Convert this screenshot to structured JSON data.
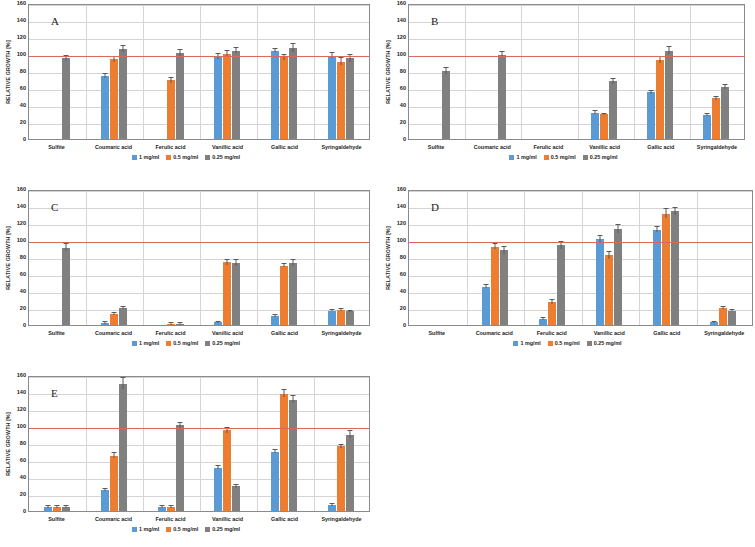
{
  "figure": {
    "ylabel": "RELATIVE GROWTH [%]",
    "ylim": [
      0,
      160
    ],
    "yticks": [
      0,
      20,
      40,
      60,
      80,
      100,
      120,
      140,
      160
    ],
    "categories": [
      "Sulfite",
      "Coumaric acid",
      "Ferulic acid",
      "Vanillic acid",
      "Gallic acid",
      "Syringaldehyde"
    ],
    "series_names": [
      "1 mg/ml",
      "0.5 mg/ml",
      "0.25 mg/ml"
    ],
    "colors": {
      "series_1": "#5B9BD5",
      "series_2": "#ED7D31",
      "series_3": "#808080",
      "reference_line": "#D9695A",
      "grid": "#d4d4d4",
      "axis": "#8a8a8a"
    },
    "reference_line_value": 100
  },
  "chart_data": [
    {
      "type": "bar",
      "panel": "A",
      "title": "A",
      "xlabel": "",
      "ylabel": "RELATIVE GROWTH [%]",
      "ylim": [
        0,
        160
      ],
      "grid": true,
      "legend_position": "bottom",
      "reference_line": 100,
      "categories": [
        "Sulfite",
        "Coumaric acid",
        "Ferulic acid",
        "Vanillic acid",
        "Gallic acid",
        "Syringaldehyde"
      ],
      "series": [
        {
          "name": "1 mg/ml",
          "values": [
            0,
            74,
            0,
            97,
            104,
            98
          ],
          "errors": [
            0,
            2,
            0,
            3,
            2,
            3
          ]
        },
        {
          "name": "0.5 mg/ml",
          "values": [
            0,
            94,
            69,
            100,
            96,
            91
          ],
          "errors": [
            0,
            3,
            3,
            3,
            3,
            4
          ]
        },
        {
          "name": "0.25 mg/ml",
          "values": [
            95,
            106,
            101,
            104,
            107,
            95
          ],
          "errors": [
            3,
            4,
            4,
            3,
            5,
            4
          ]
        }
      ]
    },
    {
      "type": "bar",
      "panel": "B",
      "title": "B",
      "xlabel": "",
      "ylabel": "RELATIVE GROWTH [%]",
      "ylim": [
        0,
        160
      ],
      "grid": true,
      "legend_position": "bottom",
      "reference_line": 100,
      "categories": [
        "Sulfite",
        "Coumaric acid",
        "Ferulic acid",
        "Vanillic acid",
        "Gallic acid",
        "Syringaldehyde"
      ],
      "series": [
        {
          "name": "1 mg/ml",
          "values": [
            0,
            0,
            0,
            31,
            55,
            28
          ],
          "errors": [
            0,
            0,
            0,
            2,
            2,
            1
          ]
        },
        {
          "name": "0.5 mg/ml",
          "values": [
            0,
            0,
            0,
            29,
            93,
            48
          ],
          "errors": [
            0,
            0,
            0,
            1,
            4,
            2
          ]
        },
        {
          "name": "0.25 mg/ml",
          "values": [
            80,
            99,
            0,
            68,
            104,
            61
          ],
          "errors": [
            3,
            3,
            0,
            3,
            4,
            2
          ]
        }
      ]
    },
    {
      "type": "bar",
      "panel": "C",
      "title": "C",
      "xlabel": "",
      "ylabel": "RELATIVE GROWTH [%]",
      "ylim": [
        0,
        160
      ],
      "grid": true,
      "legend_position": "bottom",
      "reference_line": 100,
      "categories": [
        "Sulfite",
        "Coumaric acid",
        "Ferulic acid",
        "Vanillic acid",
        "Gallic acid",
        "Syringaldehyde"
      ],
      "series": [
        {
          "name": "1 mg/ml",
          "values": [
            0,
            2,
            0,
            3,
            11,
            17
          ],
          "errors": [
            0,
            1,
            0,
            1,
            1,
            1
          ]
        },
        {
          "name": "0.5 mg/ml",
          "values": [
            0,
            13,
            1,
            74,
            70,
            18
          ],
          "errors": [
            0,
            1,
            1,
            3,
            2,
            1
          ]
        },
        {
          "name": "0.25 mg/ml",
          "values": [
            91,
            20,
            1,
            73,
            73,
            16
          ],
          "errors": [
            4,
            1,
            1,
            4,
            4,
            1
          ]
        }
      ]
    },
    {
      "type": "bar",
      "panel": "D",
      "title": "D",
      "xlabel": "",
      "ylabel": "RELATIVE GROWTH [%]",
      "ylim": [
        0,
        160
      ],
      "grid": true,
      "legend_position": "bottom",
      "reference_line": 100,
      "categories": [
        "Sulfite",
        "Coumaric acid",
        "Ferulic acid",
        "Vanillic acid",
        "Gallic acid",
        "Syringaldehyde"
      ],
      "series": [
        {
          "name": "1 mg/ml",
          "values": [
            0,
            45,
            7,
            101,
            112,
            3
          ],
          "errors": [
            0,
            2,
            1,
            4,
            3,
            1
          ]
        },
        {
          "name": "0.5 mg/ml",
          "values": [
            0,
            92,
            27,
            82,
            131,
            20
          ],
          "errors": [
            0,
            3,
            2,
            4,
            5,
            1
          ]
        },
        {
          "name": "0.25 mg/ml",
          "values": [
            0,
            88,
            94,
            113,
            134,
            17
          ],
          "errors": [
            0,
            4,
            4,
            5,
            4,
            1
          ]
        }
      ]
    },
    {
      "type": "bar",
      "panel": "E",
      "title": "E",
      "xlabel": "",
      "ylabel": "RELATIVE GROWTH [%]",
      "ylim": [
        0,
        160
      ],
      "grid": true,
      "legend_position": "bottom",
      "reference_line": 100,
      "categories": [
        "Sulfite",
        "Coumaric acid",
        "Ferulic acid",
        "Vanillic acid",
        "Gallic acid",
        "Syringaldehyde"
      ],
      "series": [
        {
          "name": "1 mg/ml",
          "values": [
            5,
            25,
            5,
            51,
            70,
            7
          ],
          "errors": [
            1,
            1,
            1,
            2,
            2,
            1
          ]
        },
        {
          "name": "0.5 mg/ml",
          "values": [
            5,
            65,
            5,
            95,
            138,
            76
          ],
          "errors": [
            1,
            3,
            1,
            3,
            4,
            2
          ]
        },
        {
          "name": "0.25 mg/ml",
          "values": [
            5,
            150,
            101,
            29,
            131,
            90
          ],
          "errors": [
            1,
            7,
            3,
            2,
            4,
            4
          ]
        }
      ]
    }
  ],
  "panel_layout": [
    {
      "panel": "A",
      "left": 0,
      "top": 4,
      "width": 372,
      "height": 168
    },
    {
      "panel": "B",
      "left": 380,
      "top": 4,
      "width": 367,
      "height": 168
    },
    {
      "panel": "C",
      "left": 0,
      "top": 190,
      "width": 372,
      "height": 168
    },
    {
      "panel": "D",
      "left": 380,
      "top": 190,
      "width": 375,
      "height": 168
    },
    {
      "panel": "E",
      "left": 0,
      "top": 376,
      "width": 372,
      "height": 168
    }
  ]
}
